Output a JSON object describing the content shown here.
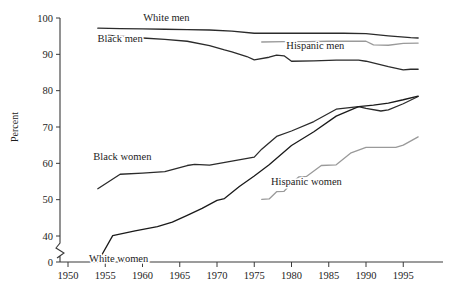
{
  "chart_data": {
    "type": "line",
    "title": "",
    "subtitle": "",
    "xlabel": "",
    "ylabel": "Percent",
    "xlim": [
      1948,
      1997.5
    ],
    "ylim": [
      0,
      100
    ],
    "y_axis_break": true,
    "y_break_between": [
      0,
      40
    ],
    "grid": false,
    "legend": "inline-labels",
    "xticks": [
      1950,
      1955,
      1960,
      1965,
      1970,
      1975,
      1980,
      1985,
      1990,
      1995
    ],
    "xtick_labels": [
      "1950",
      "1955",
      "1960",
      "1965",
      "1970",
      "1975",
      "1980",
      "1985",
      "1990",
      "1995"
    ],
    "yticks": [
      0,
      40,
      50,
      60,
      70,
      80,
      90,
      100
    ],
    "ytick_labels": [
      "0",
      "40",
      "50",
      "60",
      "70",
      "80",
      "90",
      "100"
    ],
    "series": [
      {
        "name": "White men",
        "label": "White men",
        "color": "#2b2b2b",
        "width": 1.3,
        "label_x": 1963.2,
        "label_y": 99.2,
        "x": [
          1954,
          1957,
          1960,
          1963,
          1966,
          1969,
          1972,
          1975,
          1978,
          1981,
          1984,
          1987,
          1990,
          1993,
          1996,
          1997
        ],
        "y": [
          97.2,
          97.1,
          97.0,
          96.9,
          96.8,
          96.7,
          96.4,
          95.8,
          95.8,
          95.8,
          95.8,
          95.8,
          95.7,
          95.1,
          94.6,
          94.5
        ]
      },
      {
        "name": "Black men",
        "label": "Black men",
        "color": "#2b2b2b",
        "width": 1.3,
        "label_x": 1957.0,
        "label_y": 93.3,
        "x": [
          1954,
          1957,
          1960,
          1963,
          1966,
          1969,
          1971,
          1972,
          1974,
          1975,
          1977,
          1978,
          1979,
          1980,
          1983,
          1986,
          1989,
          1990,
          1993,
          1995,
          1996,
          1997
        ],
        "y": [
          95.4,
          95.0,
          94.5,
          94.1,
          93.6,
          92.4,
          91.2,
          90.7,
          89.4,
          88.5,
          89.2,
          89.8,
          89.6,
          88.1,
          88.2,
          88.4,
          88.4,
          88.1,
          86.6,
          85.7,
          85.9,
          85.9
        ]
      },
      {
        "name": "Hispanic men",
        "label": "Hispanic men",
        "color": "#9a9a9a",
        "width": 1.3,
        "label_x": 1983.2,
        "label_y": 91.5,
        "x": [
          1976,
          1979,
          1982,
          1985,
          1988,
          1990,
          1991,
          1993,
          1995,
          1997
        ],
        "y": [
          93.4,
          93.5,
          93.5,
          93.6,
          93.6,
          93.6,
          92.6,
          92.5,
          93.0,
          93.1
        ]
      },
      {
        "name": "Black women",
        "label": "Black women",
        "color": "#2b2b2b",
        "width": 1.3,
        "label_x": 1957.3,
        "label_y": 60.8,
        "x": [
          1954,
          1957,
          1960,
          1963,
          1966,
          1967,
          1969,
          1972,
          1975,
          1976,
          1978,
          1980,
          1983,
          1986,
          1989,
          1990,
          1992,
          1993,
          1995,
          1997
        ],
        "y": [
          53.0,
          57.0,
          57.3,
          57.7,
          59.4,
          59.7,
          59.5,
          60.6,
          61.7,
          63.9,
          67.4,
          68.9,
          71.5,
          74.9,
          75.6,
          75.1,
          74.4,
          74.7,
          76.4,
          78.4
        ]
      },
      {
        "name": "White women",
        "label": "White women",
        "color": "#1a1a1a",
        "width": 1.3,
        "label_x": 1956.8,
        "label_y": 38.5,
        "x": [
          1954,
          1956,
          1959,
          1962,
          1964,
          1966,
          1968,
          1970,
          1971,
          1973,
          1975,
          1977,
          1980,
          1983,
          1986,
          1989,
          1991,
          1993,
          1995,
          1997
        ],
        "y": [
          35.9,
          40.1,
          41.4,
          42.6,
          43.8,
          45.7,
          47.6,
          49.8,
          50.3,
          53.6,
          56.5,
          59.6,
          64.9,
          68.7,
          73.0,
          75.6,
          76.0,
          76.6,
          77.5,
          78.5
        ]
      },
      {
        "name": "Hispanic women",
        "label": "Hispanic women",
        "color": "#9a9a9a",
        "width": 1.3,
        "label_x": 1982.0,
        "label_y": 54.0,
        "x": [
          1976,
          1977,
          1978,
          1979,
          1980,
          1981,
          1982,
          1984,
          1986,
          1988,
          1990,
          1992,
          1994,
          1995,
          1997
        ],
        "y": [
          50.1,
          50.2,
          52.2,
          52.3,
          54.5,
          56.3,
          56.4,
          59.4,
          59.6,
          62.9,
          64.4,
          64.4,
          64.4,
          65.0,
          67.3
        ]
      }
    ]
  }
}
